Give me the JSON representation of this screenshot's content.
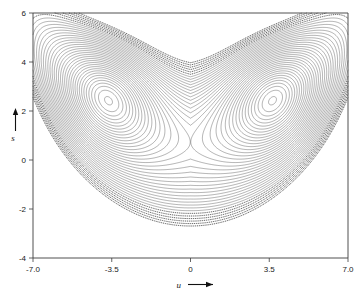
{
  "figure": {
    "kind": "phase-portrait",
    "background_color": "#ffffff",
    "line_color": "#2b2b2b",
    "frame_color": "#3c3c3c"
  },
  "chart_data": {
    "type": "line",
    "title": "",
    "subtitle": "",
    "xlabel": "u",
    "ylabel": "s",
    "xlabel_arrow": "⟶",
    "ylabel_arrow": "↑",
    "xlim": [
      -7.0,
      7.0
    ],
    "ylim": [
      -4,
      6
    ],
    "xticks": [
      -7.0,
      -3.5,
      0,
      3.5,
      7.0
    ],
    "xticklabels": [
      "-7.0",
      "-3.5",
      "0",
      "3.5",
      "7.0"
    ],
    "yticks": [
      -4,
      -2,
      0,
      2,
      4,
      6
    ],
    "yticklabels": [
      "-4",
      "-2",
      "0",
      "2",
      "4",
      "6"
    ],
    "grid": false,
    "legend": null,
    "series": [
      {
        "name": "contour-family",
        "description": "nested level curves of a two-well potential forming a V/heart shaped attractor",
        "n_curves": 46
      }
    ],
    "features": {
      "vortex_centers": [
        [
          -3.5,
          3.2
        ],
        [
          3.5,
          3.2
        ]
      ],
      "separatrix_cusp": [
        0.0,
        0.15
      ],
      "saddle_point": [
        0.0,
        1.8
      ],
      "outer_boundary_top_left": [
        -5.6,
        5.3
      ],
      "outer_boundary_top_right": [
        5.6,
        5.3
      ],
      "outer_boundary_left_tip": [
        -6.5,
        1.5
      ],
      "outer_boundary_right_tip": [
        6.5,
        1.5
      ],
      "outer_boundary_bottom": [
        0.0,
        -4.0
      ],
      "notch_top_center": [
        0.0,
        3.6
      ]
    }
  },
  "annotations": {
    "x_axis_name": "u",
    "y_axis_name": "s"
  }
}
